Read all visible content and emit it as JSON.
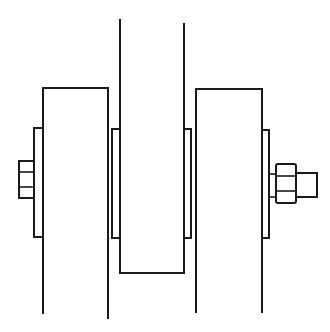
{
  "diagram": {
    "type": "mechanical-assembly-line-drawing",
    "colors": {
      "line": "#1a1a1a",
      "background": "#ffffff"
    },
    "components": [
      {
        "id": "left-plate",
        "label": ""
      },
      {
        "id": "center-plate",
        "label": ""
      },
      {
        "id": "right-plate",
        "label": ""
      },
      {
        "id": "left-outer-washer",
        "label": ""
      },
      {
        "id": "left-inner-washer",
        "label": ""
      },
      {
        "id": "right-inner-washer",
        "label": ""
      },
      {
        "id": "right-outer-washer",
        "label": ""
      },
      {
        "id": "bolt-head",
        "label": ""
      },
      {
        "id": "nut",
        "label": ""
      },
      {
        "id": "bolt-end",
        "label": ""
      }
    ]
  }
}
